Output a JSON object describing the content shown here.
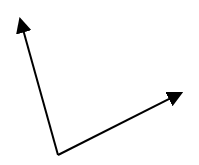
{
  "diagram": {
    "type": "vectors",
    "background": "#ffffff",
    "stroke_color": "#000000",
    "origin": {
      "x": 58,
      "y": 155
    },
    "vectors": [
      {
        "name": "vector-up-left",
        "tip": {
          "x": 19,
          "y": 15
        }
      },
      {
        "name": "vector-right",
        "tip": {
          "x": 185,
          "y": 91
        }
      }
    ]
  }
}
